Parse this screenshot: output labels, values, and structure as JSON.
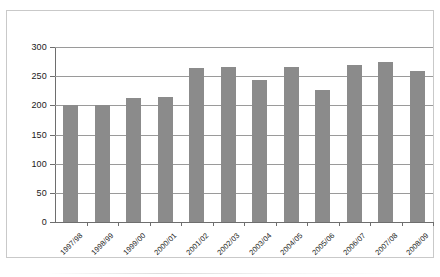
{
  "chart_data": {
    "type": "bar",
    "title": "",
    "subtitle": "",
    "xlabel": "",
    "ylabel": "",
    "ylim": [
      0,
      300
    ],
    "yticks": [
      0,
      50,
      100,
      150,
      200,
      250,
      300
    ],
    "ytick_labels": [
      "0",
      "50",
      "100",
      "150",
      "200",
      "250",
      "300"
    ],
    "grid": true,
    "legend": false,
    "legend_position": "none",
    "bar_color": "#8b8b8b",
    "categories": [
      "1997/98",
      "1998/99",
      "1999/00",
      "2000/01",
      "2001/02",
      "2002/03",
      "2003/04",
      "2004/05",
      "2005/06",
      "2006/07",
      "2007/08",
      "2008/09"
    ],
    "values": [
      200,
      200,
      213,
      215,
      264,
      265,
      243,
      265,
      227,
      270,
      275,
      259
    ]
  },
  "axes": {
    "y_axis_name": "y-axis",
    "x_axis_name": "x-axis"
  }
}
